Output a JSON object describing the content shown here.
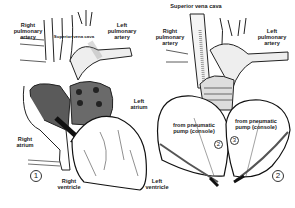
{
  "diagram": {
    "panels": [
      {
        "number": "1",
        "labels": {
          "right_pulmonary_artery": "Right\npulmonary\nartery",
          "superior_vena_cava": "Superior vena cava",
          "left_pulmonary_artery": "Left\npulmonary\nartery",
          "left_atrium": "Left\natrium",
          "right_atrium": "Right\natrium",
          "right_ventricle": "Right\nventricle"
        }
      },
      {
        "number": "2",
        "labels": {
          "superior_vena_cava": "Superior vena cava",
          "right_pulmonary_artery": "Right\npulmonary\nartery",
          "left_pulmonary_artery": "Left\npulmonary\nartery",
          "pump_left": "from pneumatic\npump (console)",
          "pump_right": "from pneumatic\npump (console)",
          "left_ventricle": "Left\nventricle",
          "marker_2": "2",
          "marker_3": "3"
        }
      }
    ],
    "colors": {
      "ink": "#222222",
      "shade": "#555555",
      "background": "#ffffff"
    }
  }
}
